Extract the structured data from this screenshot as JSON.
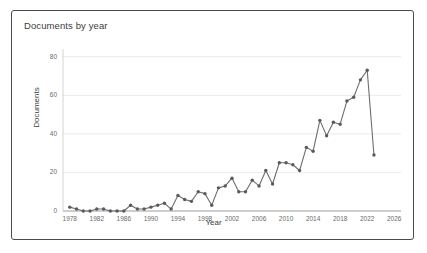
{
  "card": {
    "title": "Documents by year",
    "border_color": "#4a4a4a",
    "background": "#ffffff"
  },
  "chart_data": {
    "type": "line",
    "title": "Documents by year",
    "xlabel": "Year",
    "ylabel": "Documents",
    "xlim": [
      1977,
      2027
    ],
    "ylim": [
      0,
      84
    ],
    "xticks": [
      1978,
      1982,
      1986,
      1990,
      1994,
      1998,
      2002,
      2006,
      2010,
      2014,
      2018,
      2022,
      2026
    ],
    "yticks": [
      0,
      20,
      40,
      60,
      80
    ],
    "grid": true,
    "grid_axis": "y",
    "legend": false,
    "line_color": "#6e6e6e",
    "marker": "circle",
    "marker_color": "#5a5a5a",
    "x": [
      1978,
      1979,
      1980,
      1981,
      1982,
      1983,
      1984,
      1985,
      1986,
      1987,
      1988,
      1989,
      1990,
      1991,
      1992,
      1993,
      1994,
      1995,
      1996,
      1997,
      1998,
      1999,
      2000,
      2001,
      2002,
      2003,
      2004,
      2005,
      2006,
      2007,
      2008,
      2009,
      2010,
      2011,
      2012,
      2013,
      2014,
      2015,
      2016,
      2017,
      2018,
      2019,
      2020,
      2021,
      2022,
      2023
    ],
    "values": [
      2,
      1,
      0,
      0,
      1,
      1,
      0,
      0,
      0,
      3,
      1,
      1,
      2,
      3,
      4,
      1,
      8,
      6,
      5,
      10,
      9,
      3,
      12,
      13,
      17,
      10,
      10,
      16,
      13,
      21,
      14,
      25,
      25,
      24,
      21,
      33,
      31,
      47,
      39,
      46,
      45,
      57,
      59,
      68,
      73,
      29
    ],
    "series": [
      {
        "name": "Documents",
        "values": [
          2,
          1,
          0,
          0,
          1,
          1,
          0,
          0,
          0,
          3,
          1,
          1,
          2,
          3,
          4,
          1,
          8,
          6,
          5,
          10,
          9,
          3,
          12,
          13,
          17,
          10,
          10,
          16,
          13,
          21,
          14,
          25,
          25,
          24,
          21,
          33,
          31,
          47,
          39,
          46,
          45,
          57,
          59,
          68,
          73,
          29
        ]
      }
    ]
  }
}
